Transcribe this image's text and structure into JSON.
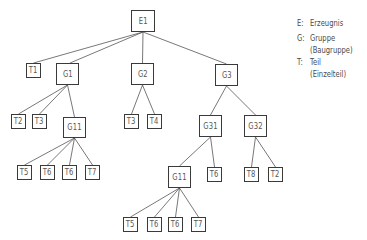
{
  "diagram": {
    "type": "product-structure-tree",
    "nodes": [
      {
        "label": "E1"
      },
      {
        "label": "T1"
      },
      {
        "label": "G1"
      },
      {
        "label": "G2"
      },
      {
        "label": "G3"
      },
      {
        "label": "T2"
      },
      {
        "label": "T3"
      },
      {
        "label": "G11"
      },
      {
        "label": "T3"
      },
      {
        "label": "T4"
      },
      {
        "label": "G31"
      },
      {
        "label": "G32"
      },
      {
        "label": "T5"
      },
      {
        "label": "T6"
      },
      {
        "label": "T6"
      },
      {
        "label": "T7"
      },
      {
        "label": "G11"
      },
      {
        "label": "T6"
      },
      {
        "label": "T8"
      },
      {
        "label": "T2"
      },
      {
        "label": "T5"
      },
      {
        "label": "T6"
      },
      {
        "label": "T6"
      },
      {
        "label": "T7"
      }
    ],
    "edges": [
      [
        "E1",
        "T1"
      ],
      [
        "E1",
        "G1"
      ],
      [
        "E1",
        "G2"
      ],
      [
        "E1",
        "G3"
      ],
      [
        "G1",
        "T2"
      ],
      [
        "G1",
        "T3"
      ],
      [
        "G1",
        "G11"
      ],
      [
        "G2",
        "T3"
      ],
      [
        "G2",
        "T4"
      ],
      [
        "G3",
        "G31"
      ],
      [
        "G3",
        "G32"
      ],
      [
        "G11",
        "T5"
      ],
      [
        "G11",
        "T6"
      ],
      [
        "G11",
        "T6"
      ],
      [
        "G11",
        "T7"
      ],
      [
        "G31",
        "G11"
      ],
      [
        "G31",
        "T6"
      ],
      [
        "G32",
        "T8"
      ],
      [
        "G32",
        "T2"
      ],
      [
        "G11",
        "T5"
      ],
      [
        "G11",
        "T6"
      ],
      [
        "G11",
        "T6"
      ],
      [
        "G11",
        "T7"
      ]
    ]
  },
  "legend": {
    "items": [
      {
        "key": "E:",
        "text": "Erzeugnis"
      },
      {
        "key": "G:",
        "text": "Gruppe"
      },
      {
        "key": "",
        "text": "(Baugruppe)"
      },
      {
        "key": "T:",
        "text": "Teil"
      },
      {
        "key": "",
        "text": "(Einzelteil)"
      }
    ]
  }
}
